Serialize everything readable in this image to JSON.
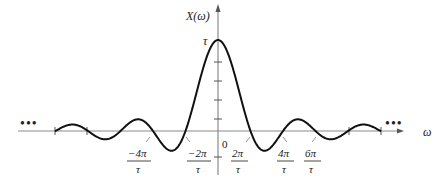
{
  "figure": {
    "y_axis_label": "X(ω)",
    "x_axis_label": "ω",
    "peak_label": "τ",
    "origin_label": "0",
    "ellipsis_left": "•••",
    "ellipsis_right": "•••",
    "tick_labels": [
      {
        "num": "−4π",
        "den": "τ"
      },
      {
        "num": "−2π",
        "den": "τ"
      },
      {
        "num": "2π",
        "den": "τ"
      },
      {
        "num": "4π",
        "den": "τ"
      },
      {
        "num": "6π",
        "den": "τ"
      }
    ],
    "colors": {
      "axis": "#777777",
      "curve": "#111111",
      "text": "#222222"
    }
  },
  "chart_data": {
    "type": "line",
    "title": "",
    "function": "X(ω) = τ·sinc(ωτ/2) = 2·sin(ωτ/2)/ω",
    "xlabel": "ω",
    "ylabel": "X(ω)",
    "x_units": "π/τ",
    "peak": {
      "x": 0,
      "y": "τ"
    },
    "zero_crossings_pi_over_tau": [
      -10,
      -8,
      -6,
      -4,
      -2,
      2,
      4,
      6,
      8,
      10
    ],
    "labeled_ticks": [
      "-4π/τ",
      "-2π/τ",
      "2π/τ",
      "4π/τ",
      "6π/τ"
    ],
    "y_ticks_below_peak": 4,
    "continues_both_directions": true
  }
}
